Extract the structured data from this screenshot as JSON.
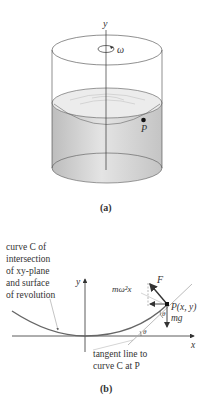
{
  "figure_a": {
    "caption": "(a)",
    "axis_label": "y",
    "rotation_label": "ω",
    "point_label": "P"
  },
  "figure_b": {
    "caption": "(b)",
    "curve_annotation": [
      "curve C of",
      "intersection",
      "of xy-plane",
      "and surface",
      "of revolution"
    ],
    "y_axis_label": "y",
    "x_axis_label": "x",
    "force_F": "F",
    "centripetal_label": "mω²x",
    "point_label": "P(x, y)",
    "gravity_label": "mg",
    "theta_at_point": "θ",
    "theta_at_axis": "θ",
    "tangent_annotation": [
      "tangent line to",
      "curve C at P"
    ]
  },
  "colors": {
    "line": "#333333",
    "liquid": "#d0d0d0",
    "curve": "#666666",
    "tangent": "#aaaaaa"
  }
}
